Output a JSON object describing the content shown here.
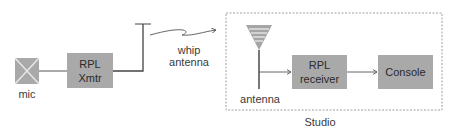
{
  "diagram": {
    "mic": {
      "label": "mic"
    },
    "transmitter": {
      "line1": "RPL",
      "line2": "Xmtr"
    },
    "whip": {
      "line1": "whip",
      "line2": "antenna"
    },
    "studio": {
      "label": "Studio",
      "antenna_label": "antenna",
      "receiver": {
        "line1": "RPL",
        "line2": "receiver"
      },
      "console": {
        "label": "Console"
      }
    },
    "colors": {
      "box_fill": "#a9a9a9",
      "line": "#555555",
      "dash": "#888888"
    }
  }
}
